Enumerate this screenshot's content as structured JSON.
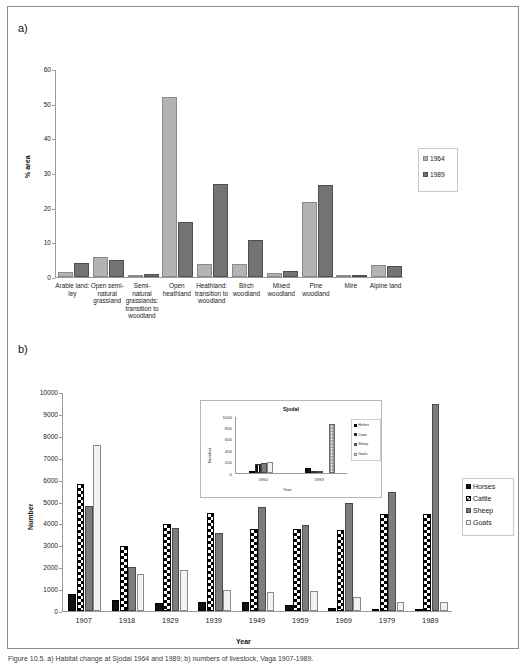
{
  "figure": {
    "panel_a_letter": "a)",
    "panel_b_letter": "b)",
    "caption": "Figure 10.5. a) Habitat change at Sjodal 1964 and 1989; b) numbers of livestock, Vaga 1907-1989."
  },
  "chart_data": [
    {
      "id": "panel-a",
      "type": "bar",
      "title": "",
      "xlabel": "",
      "ylabel": "% area",
      "ylim": [
        0,
        60
      ],
      "yticks": [
        0,
        10,
        20,
        30,
        40,
        50,
        60
      ],
      "grid": false,
      "legend_position": "right",
      "categories": [
        "Arable land:\nley",
        "Open semi-\nnatural\ngrassland",
        "Semi-\nnatural\ngrasslands:\ntransition to\nwoodland",
        "Open\nheathland",
        "Heathland:\ntransition to\nwoodland",
        "Birch\nwoodland",
        "Mixed\nwoodland",
        "Pine\nwoodland",
        "Mire",
        "Alpine land"
      ],
      "series": [
        {
          "name": "1964",
          "color": "#b3b3b3",
          "values": [
            1.4,
            5.9,
            0.4,
            51.8,
            3.8,
            3.7,
            1.2,
            21.6,
            0.15,
            3.6
          ]
        },
        {
          "name": "1989",
          "color": "#737373",
          "values": [
            3.9,
            4.8,
            0.9,
            15.8,
            26.8,
            10.8,
            1.7,
            26.6,
            0.2,
            3.1
          ]
        }
      ]
    },
    {
      "id": "panel-b",
      "type": "bar",
      "title": "",
      "xlabel": "Year",
      "ylabel": "Number",
      "ylim": [
        0,
        10000
      ],
      "yticks": [
        0,
        1000,
        2000,
        3000,
        4000,
        5000,
        6000,
        7000,
        8000,
        9000,
        10000
      ],
      "grid": false,
      "legend_position": "right",
      "categories": [
        "1907",
        "1918",
        "1929",
        "1939",
        "1949",
        "1959",
        "1969",
        "1979",
        "1989"
      ],
      "series": [
        {
          "name": "Horses",
          "pattern": "solid-black",
          "values": [
            760,
            500,
            380,
            420,
            400,
            260,
            140,
            70,
            40
          ]
        },
        {
          "name": "Cattle",
          "pattern": "checkerboard",
          "values": [
            5790,
            2990,
            3980,
            4480,
            3740,
            3740,
            3680,
            4450,
            4440
          ]
        },
        {
          "name": "Sheep",
          "pattern": "solid-gray",
          "values": [
            4780,
            2000,
            3790,
            3560,
            4760,
            3940,
            4930,
            5420,
            9430
          ]
        },
        {
          "name": "Goats",
          "pattern": "open-white",
          "values": [
            7590,
            1700,
            1870,
            960,
            880,
            930,
            620,
            430,
            400
          ]
        }
      ],
      "inset": {
        "id": "panel-b-inset",
        "type": "bar",
        "title": "Sjodal",
        "xlabel": "Year",
        "ylabel": "Number",
        "ylim": [
          0,
          1000
        ],
        "yticks": [
          0,
          200,
          400,
          600,
          800,
          1000
        ],
        "categories": [
          "1960",
          "1993"
        ],
        "series": [
          {
            "name": "Heifers",
            "pattern": "solid-black",
            "values": [
              30,
              95
            ]
          },
          {
            "name": "Cows",
            "pattern": "striped",
            "values": [
              155,
              25
            ]
          },
          {
            "name": "Sheep",
            "pattern": "solid-gray",
            "values": [
              170,
              15
            ]
          },
          {
            "name": "Goats",
            "pattern": "open-white",
            "values": [
              200,
              0
            ]
          },
          {
            "name": "Dotted",
            "pattern": "dotted",
            "values": [
              0,
              855
            ]
          }
        ]
      }
    }
  ]
}
